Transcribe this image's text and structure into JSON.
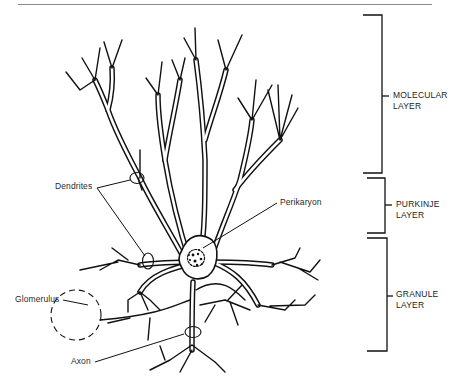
{
  "figure": {
    "labels": {
      "dendrites": "Dendrites",
      "perikaryon": "Perikaryon",
      "glomerulus": "Glomerulus",
      "axon": "Axon"
    },
    "layers": [
      {
        "line1": "MOLECULAR",
        "line2": "LAYER"
      },
      {
        "line1": "PURKINJE",
        "line2": "LAYER"
      },
      {
        "line1": "GRANULE",
        "line2": "LAYER"
      }
    ],
    "colors": {
      "ink": "#111111",
      "background": "#ffffff",
      "rule": "#8a8a8a"
    }
  }
}
